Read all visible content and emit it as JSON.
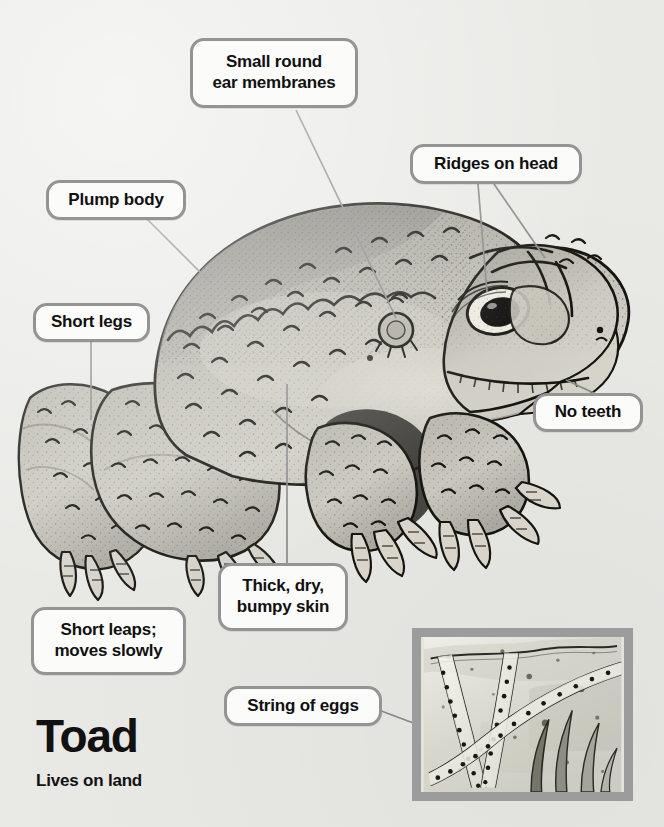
{
  "page": {
    "background_color": "#e9e9e6",
    "label_border_color": "#949494",
    "label_fill_color": "#fbfbfa",
    "text_color": "#111111",
    "leader_line_color": "#8a8a8a",
    "inset_frame_color": "#9c9c9c"
  },
  "title": {
    "name": "Toad",
    "subtitle": "Lives on land"
  },
  "callouts": [
    {
      "id": "ear-membranes",
      "text": "Small round\near membranes",
      "lines": [
        "Small round",
        "ear membranes"
      ]
    },
    {
      "id": "ridges-on-head",
      "text": "Ridges on head",
      "lines": [
        "Ridges on head"
      ]
    },
    {
      "id": "plump-body",
      "text": "Plump body",
      "lines": [
        "Plump body"
      ]
    },
    {
      "id": "short-legs",
      "text": "Short legs",
      "lines": [
        "Short legs"
      ]
    },
    {
      "id": "no-teeth",
      "text": "No teeth",
      "lines": [
        "No teeth"
      ]
    },
    {
      "id": "bumpy-skin",
      "text": "Thick, dry,\nbumpy skin",
      "lines": [
        "Thick, dry,",
        "bumpy skin"
      ]
    },
    {
      "id": "short-leaps",
      "text": "Short leaps;\nmoves slowly",
      "lines": [
        "Short leaps;",
        "moves slowly"
      ]
    },
    {
      "id": "string-of-eggs",
      "text": "String of eggs",
      "lines": [
        "String of eggs"
      ]
    }
  ],
  "illustration": {
    "subject": "toad",
    "description": "Side view watercolour and ink illustration of a warty toad facing right",
    "inset_subject": "string of toad eggs wound around pond weed stems"
  }
}
